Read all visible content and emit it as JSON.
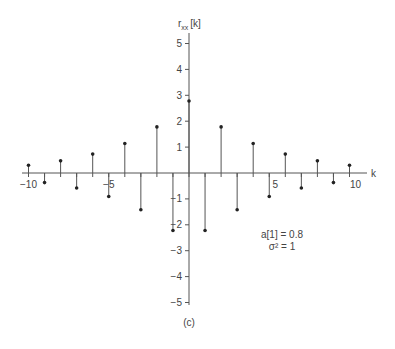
{
  "chart_data": {
    "type": "stem",
    "title": "",
    "xlabel": "k",
    "ylabel": "r_xx [k]",
    "ylabel_main": "r",
    "ylabel_sub": "xx",
    "ylabel_rest": "[k]",
    "xlim": [
      -10,
      10
    ],
    "ylim": [
      -5,
      5
    ],
    "x_ticks": [
      -10,
      -9,
      -8,
      -7,
      -6,
      -5,
      -4,
      -3,
      -2,
      -1,
      0,
      1,
      2,
      3,
      4,
      5,
      6,
      7,
      8,
      9,
      10
    ],
    "x_tick_labels": [
      {
        "k": -10,
        "label": "−10"
      },
      {
        "k": -5,
        "label": "−5"
      },
      {
        "k": 5,
        "label": "5"
      },
      {
        "k": 10,
        "label": "10"
      }
    ],
    "y_tick_labels": [
      {
        "v": 5,
        "label": "5"
      },
      {
        "v": 4,
        "label": "4"
      },
      {
        "v": 3,
        "label": "3"
      },
      {
        "v": 2,
        "label": "2"
      },
      {
        "v": 1,
        "label": "1"
      },
      {
        "v": -1,
        "label": "−1"
      },
      {
        "v": -2,
        "label": "−2"
      },
      {
        "v": -3,
        "label": "−3"
      },
      {
        "v": -4,
        "label": "−4"
      },
      {
        "v": -5,
        "label": "−5"
      }
    ],
    "x": [
      -10,
      -9,
      -8,
      -7,
      -6,
      -5,
      -4,
      -3,
      -2,
      -1,
      0,
      1,
      2,
      3,
      4,
      5,
      6,
      7,
      8,
      9,
      10
    ],
    "values": [
      0.3,
      -0.37,
      0.47,
      -0.58,
      0.73,
      -0.91,
      1.14,
      -1.42,
      1.78,
      -2.22,
      2.78,
      -2.22,
      1.78,
      -1.42,
      1.14,
      -0.91,
      0.73,
      -0.58,
      0.47,
      -0.37,
      0.3
    ],
    "annotations": [
      "a[1] = 0.8",
      "σ² = 1"
    ],
    "caption": "(c)",
    "grid": false,
    "legend": null
  },
  "annotation_line1": "a[1] = 0.8",
  "annotation_line2": "σ² = 1",
  "caption": "(c)",
  "colors": {
    "axis": "#555555",
    "stem": "#555555",
    "marker": "#222222",
    "text": "#444444"
  }
}
